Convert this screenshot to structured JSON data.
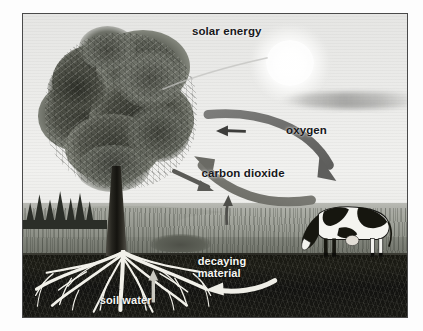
{
  "figure": {
    "type": "diagram",
    "medium": "grayscale pencil illustration",
    "frame_color": "#4a4a4a",
    "background_color": "#ffffff"
  },
  "labels": {
    "solar_energy": "solar energy",
    "oxygen": "oxygen",
    "carbon_dioxide": "carbon dioxide",
    "decaying_material_line1": "decaying",
    "decaying_material_line2": "material",
    "soil_water": "soil water"
  },
  "label_colors": {
    "on_sky": "#17171a",
    "on_soil": "#f6f6f2"
  },
  "elements": {
    "sun": "sun",
    "cloud": "cloud",
    "tree": "deciduous tree",
    "tree_canopy": "leafy canopy",
    "tree_trunk": "trunk",
    "tree_roots": "root system",
    "cow": "grazing dairy cow",
    "grass": "grass field",
    "hills": "rolling hills",
    "treeline": "distant conifer treeline",
    "bush": "shrub",
    "soil": "soil layer"
  },
  "flows": [
    {
      "name": "oxygen",
      "label": "oxygen",
      "from": "tree",
      "to": "cow",
      "direction": "tree-to-cow",
      "style": "thick curved arrow arcing over the field",
      "color": "#6e6e6e"
    },
    {
      "name": "carbon-dioxide",
      "label": "carbon dioxide",
      "from": "cow",
      "to": "tree",
      "direction": "cow-to-tree",
      "style": "thick curved arrow sweeping left and up",
      "color": "#7a7a7a"
    },
    {
      "name": "solar-energy",
      "label": "solar energy",
      "from": "sun",
      "to": "tree",
      "direction": "sun-to-tree",
      "style": "faint ray",
      "color": "#b8b8b6"
    },
    {
      "name": "decaying-material",
      "label": "decaying material",
      "from": "surface",
      "to": "soil",
      "direction": "into-soil",
      "style": "pale curved arrow in dark soil",
      "color": "#efeee7"
    },
    {
      "name": "soil-water",
      "label": "soil water",
      "from": "soil",
      "to": "roots",
      "direction": "upward-into-roots",
      "style": "small pale upward arrow",
      "color": "#d8d7ce"
    },
    {
      "name": "uptake",
      "label": "",
      "from": "ground",
      "to": "atmosphere",
      "direction": "upward",
      "style": "small slim arrow above field",
      "color": "#5e5e5a"
    }
  ],
  "small_arrows": [
    {
      "name": "oxygen-direction-marker",
      "direction": "left"
    },
    {
      "name": "co2-direction-marker",
      "direction": "left-down"
    }
  ]
}
